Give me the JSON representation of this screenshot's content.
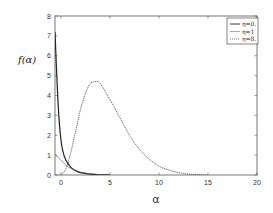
{
  "chart_data": {
    "type": "line",
    "title": "",
    "xlabel": "α",
    "ylabel": "f(α)",
    "xlim": [
      -0.6,
      20
    ],
    "ylim": [
      0,
      8
    ],
    "xticks": [
      0,
      5,
      10,
      15,
      20
    ],
    "yticks": [
      0,
      1,
      2,
      3,
      4,
      5,
      6,
      7,
      8
    ],
    "grid": false,
    "legend_position": "upper right",
    "series": [
      {
        "name": "η=0.",
        "style": "solid",
        "color": "#222222",
        "x": [
          -0.6,
          -0.4,
          -0.2,
          0,
          0.2,
          0.5,
          1,
          1.5,
          2,
          3,
          4,
          5
        ],
        "y": [
          7.2,
          4.8,
          2.9,
          1.8,
          1.2,
          0.75,
          0.4,
          0.22,
          0.12,
          0.04,
          0.01,
          0.0
        ]
      },
      {
        "name": "η=1",
        "style": "thin-solid",
        "color": "#555555",
        "x": [
          -0.6,
          0,
          0.5,
          1,
          1.5,
          2,
          3,
          4,
          5
        ],
        "y": [
          1.05,
          0.75,
          0.5,
          0.33,
          0.22,
          0.14,
          0.06,
          0.02,
          0.0
        ]
      },
      {
        "name": "η=8.",
        "style": "dotted",
        "color": "#444444",
        "x": [
          0,
          0.5,
          1,
          1.5,
          2,
          2.5,
          3,
          3.5,
          4,
          5,
          6,
          7,
          8,
          9,
          10,
          11,
          12,
          13,
          14,
          15
        ],
        "y": [
          0.0,
          0.3,
          1.1,
          2.2,
          3.3,
          4.1,
          4.6,
          4.7,
          4.6,
          3.8,
          2.9,
          2.0,
          1.3,
          0.8,
          0.45,
          0.25,
          0.12,
          0.05,
          0.02,
          0.0
        ]
      }
    ]
  },
  "labels": {
    "ylabel": "f(α)",
    "xlabel": "α",
    "xticks": [
      "0",
      "5",
      "10",
      "15",
      "20"
    ],
    "yticks": [
      "0",
      "1",
      "2",
      "3",
      "4",
      "5",
      "6",
      "7",
      "8"
    ],
    "legend": [
      "η=0.",
      "η=1",
      "η=8."
    ]
  }
}
